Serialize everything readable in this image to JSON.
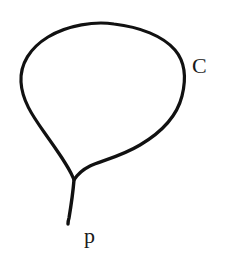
{
  "figure": {
    "kind": "hand-drawn-math-diagram",
    "background_color": "#ffffff",
    "ink_color": "#111111",
    "stroke_width_px": 3,
    "canvas": {
      "width": 225,
      "height": 258
    },
    "labels": [
      {
        "id": "curve-label",
        "text": "C",
        "meaning": "the closed curve",
        "x": 193,
        "y": 58,
        "font_style": "serif-uppercase"
      },
      {
        "id": "cusp-label",
        "text": "p",
        "meaning": "the cusp point on the curve",
        "x": 85,
        "y": 228,
        "font_style": "serif-lowercase"
      }
    ],
    "geometry": {
      "apex": {
        "x": 110,
        "y": 24
      },
      "leftmost": {
        "x": 21,
        "y": 80
      },
      "rightmost": {
        "x": 185,
        "y": 78
      },
      "cusp": {
        "x": 74,
        "y": 180
      },
      "tail_end": {
        "x": 68,
        "y": 224
      },
      "outline_path": "M 74 180 C 70 168 58 152 44 132 C 32 115 22 100 21 82 C 20 64 30 48 48 37 C 68 25 95 21 114 24 C 140 27 163 36 175 50 C 186 63 186 80 182 96 C 177 116 162 132 140 145 C 120 157 100 161 90 166 C 82 170 77 175 74 180 Z",
      "tail_path": "M 74 180 C 73 192 71 206 69 218 C 68 221 68 223 68 224"
    }
  }
}
